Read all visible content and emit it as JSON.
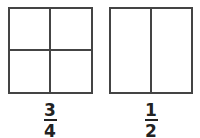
{
  "diagram": {
    "shapes": [
      {
        "id": "left-square",
        "divisions": "2x2 grid",
        "parts": 4,
        "fraction": {
          "numerator": "3",
          "denominator": "4"
        }
      },
      {
        "id": "right-square",
        "divisions": "2 vertical halves",
        "parts": 2,
        "fraction": {
          "numerator": "1",
          "denominator": "2"
        }
      }
    ],
    "colors": {
      "line": "#444444",
      "text": "#222222",
      "background": "#ffffff"
    }
  }
}
